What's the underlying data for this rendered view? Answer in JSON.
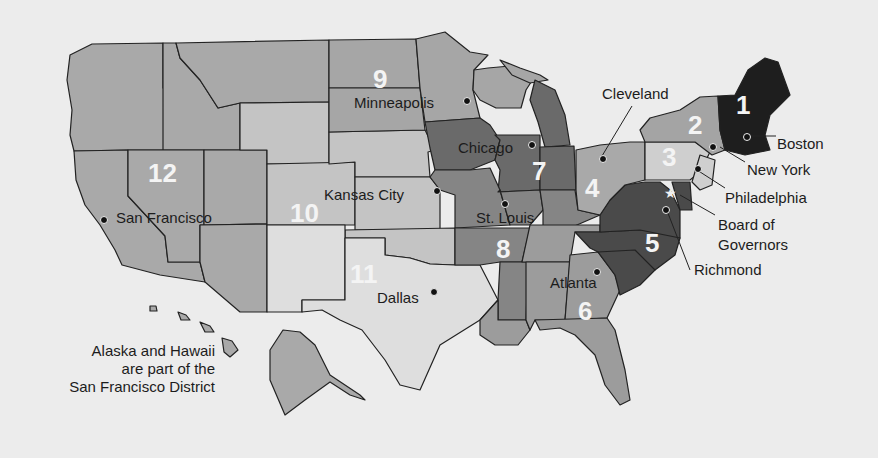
{
  "colors": {
    "background": "#ececec",
    "d1": "#1e1e1e",
    "d2": "#a4a4a4",
    "d3": "#cfcfcf",
    "d4": "#a9a9a9",
    "d5": "#4a4a4a",
    "d6": "#9c9c9c",
    "d7": "#6a6a6a",
    "d8": "#858585",
    "d9": "#a6a6a6",
    "d10": "#c4c4c4",
    "d11": "#dedede",
    "d12": "#a9a9a9"
  },
  "districts": [
    {
      "number": "1",
      "city": "Boston"
    },
    {
      "number": "2",
      "city": "New York"
    },
    {
      "number": "3",
      "city": "Philadelphia"
    },
    {
      "number": "4",
      "city": "Cleveland"
    },
    {
      "number": "5",
      "city": "Richmond"
    },
    {
      "number": "6",
      "city": "Atlanta"
    },
    {
      "number": "7",
      "city": "Chicago"
    },
    {
      "number": "8",
      "city": "St. Louis"
    },
    {
      "number": "9",
      "city": "Minneapolis"
    },
    {
      "number": "10",
      "city": "Kansas City"
    },
    {
      "number": "11",
      "city": "Dallas"
    },
    {
      "number": "12",
      "city": "San Francisco"
    }
  ],
  "board": {
    "line1": "Board of",
    "line2": "Governors",
    "icon": "star-icon"
  },
  "note": {
    "line1": "Alaska and Hawaii",
    "line2": "are part of the",
    "line3": "San Francisco District"
  }
}
